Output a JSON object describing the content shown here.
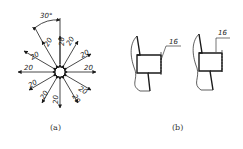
{
  "figure_a": {
    "caption": "(a)",
    "angle_label": "30°",
    "radial_dimension_labels": [
      "20",
      "20",
      "20",
      "20",
      "20",
      "20",
      "20",
      "20",
      "20",
      "20",
      "20",
      "20"
    ]
  },
  "figure_b": {
    "caption": "(b)",
    "left_dimension": "16",
    "right_dimension": "16"
  },
  "colors": {
    "line": "#1a1a1a",
    "background": "#ffffff"
  }
}
